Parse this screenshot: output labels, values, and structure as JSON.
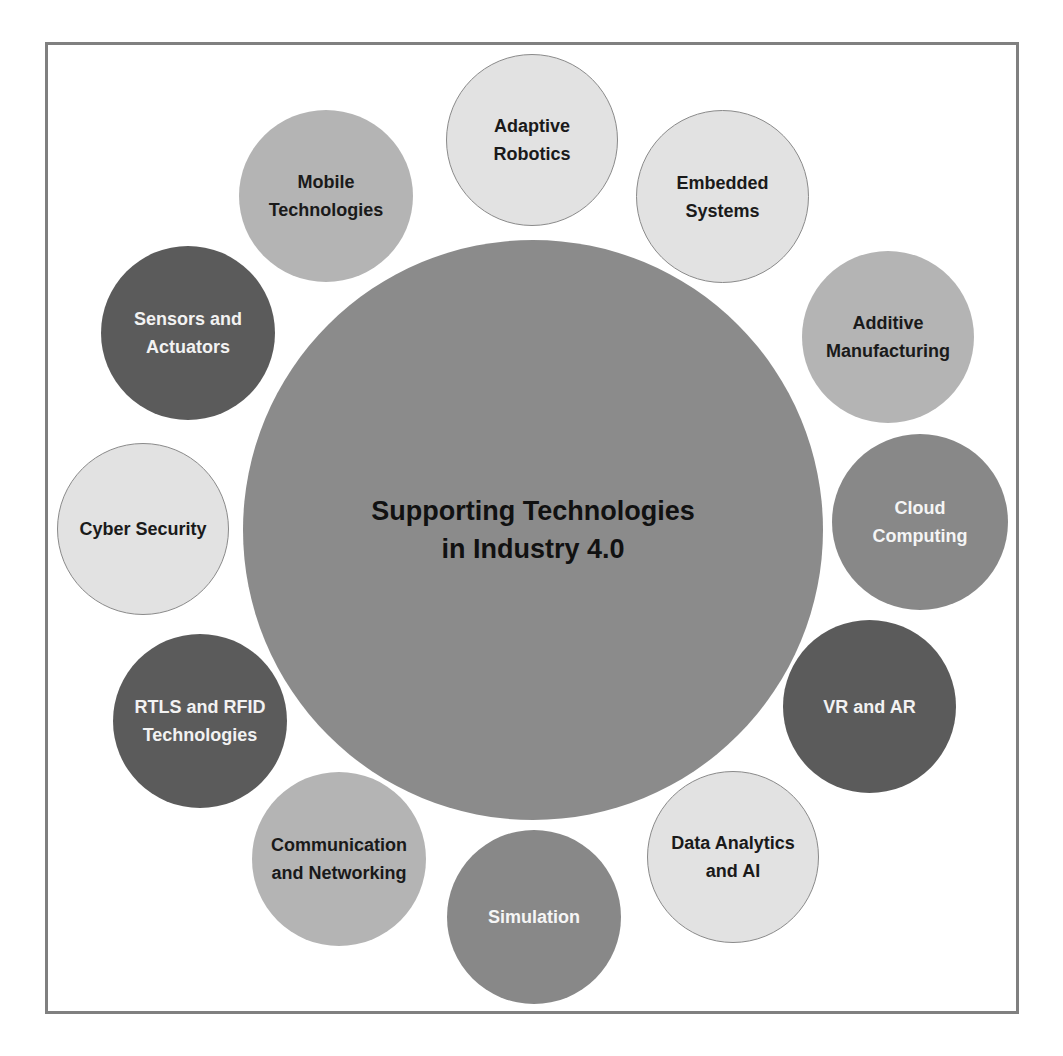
{
  "diagram": {
    "center": {
      "title": "Supporting Technologies\nin Industry 4.0",
      "fill": "#8b8b8b"
    },
    "nodes": [
      {
        "label": "Adaptive\nRobotics",
        "tone": "very-light"
      },
      {
        "label": "Embedded\nSystems",
        "tone": "very-light"
      },
      {
        "label": "Additive\nManufacturing",
        "tone": "light"
      },
      {
        "label": "Cloud\nComputing",
        "tone": "medium"
      },
      {
        "label": "VR and AR",
        "tone": "dark"
      },
      {
        "label": "Data Analytics\nand AI",
        "tone": "very-light"
      },
      {
        "label": "Simulation",
        "tone": "medium"
      },
      {
        "label": "Communication\nand Networking",
        "tone": "light"
      },
      {
        "label": "RTLS and RFID\nTechnologies",
        "tone": "dark"
      },
      {
        "label": "Cyber Security",
        "tone": "very-light"
      },
      {
        "label": "Sensors and\nActuators",
        "tone": "dark"
      },
      {
        "label": "Mobile\nTechnologies",
        "tone": "light"
      }
    ],
    "colors": {
      "very-light": "#e2e2e2",
      "light": "#b4b4b4",
      "medium": "#888888",
      "dark": "#5b5b5b",
      "frame": "#808080"
    }
  }
}
